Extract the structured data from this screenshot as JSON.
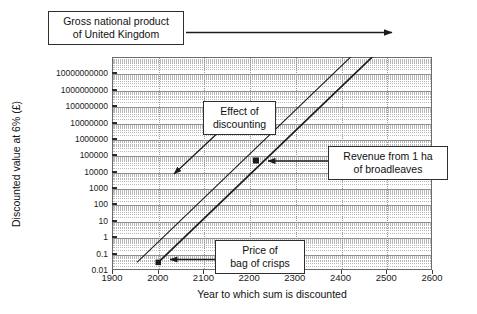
{
  "chart_data": {
    "type": "line",
    "title": "",
    "xlabel": "Year to which sum is discounted",
    "ylabel": "Discounted value at 6% (£)",
    "xlim": [
      1900,
      2600
    ],
    "xticks": [
      1900,
      2000,
      2100,
      2200,
      2300,
      2400,
      2500,
      2600
    ],
    "xticklabels": [
      "1900",
      "2000",
      "2100",
      "2200",
      "2300",
      "2400",
      "2500",
      "2600"
    ],
    "yscale": "log",
    "ylim": [
      0.01,
      100000000000
    ],
    "yticks": [
      0.01,
      0.1,
      1,
      10,
      100,
      1000,
      10000,
      100000,
      1000000,
      10000000,
      100000000,
      1000000000,
      10000000000
    ],
    "yticklabels": [
      "0.01",
      "0.1",
      "1",
      "10",
      "100",
      "1000",
      "10000",
      "100000",
      "1000000",
      "10000000",
      "100000000",
      "1000000000",
      "10000000000"
    ],
    "grid": "major and minor log grid, dotted",
    "legend": "none (annotated call-outs instead)",
    "series": [
      {
        "name": "Price of bag of crisps discounted",
        "style": "solid thick line with arrow head at upper end",
        "points": [
          [
            2000,
            0.1
          ],
          [
            2500,
            100000000000
          ]
        ]
      },
      {
        "name": "Revenue from 1 ha of broadleaves discounted",
        "style": "solid thin parallel line, offset left",
        "points": [
          [
            1955,
            0.1
          ],
          [
            2440,
            100000000000
          ]
        ]
      }
    ],
    "annotations": [
      {
        "id": "gnp",
        "text": "Gross national product of United Kingdom",
        "target": [
          2500,
          100000000000
        ],
        "arrow": "horizontal-right"
      },
      {
        "id": "effect",
        "text": "Effect of discounting",
        "target": [
          2010,
          1000
        ],
        "arrow": "diagonal-down-left"
      },
      {
        "id": "revenue",
        "text": "Revenue from 1 ha of broadleaves",
        "target": [
          2200,
          10000
        ],
        "arrow": "horizontal-left"
      },
      {
        "id": "crisps",
        "text": "Price of bag of crisps",
        "target": [
          2000,
          0.1
        ],
        "arrow": "horizontal-left"
      }
    ]
  },
  "axes": {
    "y_title": "Discounted value at 6% (£)",
    "x_title": "Year to which sum is discounted",
    "y_labels": [
      "10000000000",
      "1000000000",
      "100000000",
      "10000000",
      "1000000",
      "100000",
      "10000",
      "1000",
      "100",
      "10",
      "1",
      "0.1",
      "0.01"
    ],
    "x_labels": [
      "1900",
      "2000",
      "2100",
      "2200",
      "2300",
      "2400",
      "2500",
      "2600"
    ]
  },
  "callouts": {
    "gnp": {
      "line1": "Gross national product",
      "line2": "of United Kingdom"
    },
    "effect": {
      "line1": "Effect of",
      "line2": "discounting"
    },
    "revenue": {
      "line1": "Revenue from 1 ha",
      "line2": "of broadleaves"
    },
    "crisps": {
      "line1": "Price of",
      "line2": "bag of crisps"
    }
  },
  "colors": {
    "line": "#1c1c1c",
    "frame": "#6b6b6b",
    "grid_major": "#8e8e8e",
    "grid_minor": "#b8b8b8",
    "background": "#ffffff",
    "text": "#111111"
  }
}
